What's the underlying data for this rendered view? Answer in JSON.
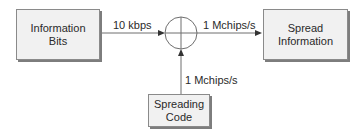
{
  "diagram": {
    "blocks": {
      "information_bits": {
        "label": "Information\nBits"
      },
      "spread_information": {
        "label": "Spread\nInformation"
      },
      "spreading_code": {
        "label": "Spreading\nCode"
      }
    },
    "junction": {
      "type": "multiplier",
      "symbol": "circle-plus"
    },
    "edges": {
      "info_to_junction": {
        "label": "10 kbps"
      },
      "junction_to_spread": {
        "label": "1 Mchips/s"
      },
      "code_to_junction": {
        "label": "1 Mchips/s"
      }
    },
    "colors": {
      "box_fill": "#f1f1f1",
      "box_border": "#8a8a8a",
      "shadow": "#7d7d7d",
      "line": "#6e6e6e",
      "text": "#2a2a2a"
    }
  }
}
